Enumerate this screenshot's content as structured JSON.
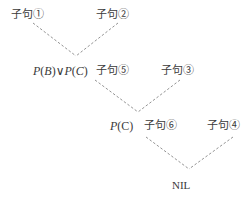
{
  "diagram": {
    "type": "resolution-refutation-tree",
    "nodes": {
      "clause1": {
        "label": "子句①"
      },
      "clause2": {
        "label": "子句②"
      },
      "resolvent1": {
        "expr_parts": [
          "P",
          "(",
          "B",
          ")",
          "∨",
          "P",
          "(",
          "C",
          ")"
        ],
        "text": "P(B)∨P(C)"
      },
      "clause5": {
        "label": "子句⑤"
      },
      "clause3": {
        "label": "子句③"
      },
      "resolvent2": {
        "expr_parts": [
          "P",
          "(",
          "C",
          ")"
        ],
        "text": "P(C)"
      },
      "clause6": {
        "label": "子句⑥"
      },
      "clause4": {
        "label": "子句④"
      },
      "result": {
        "label": "NIL"
      }
    },
    "edges": [
      {
        "from": "clause1",
        "to": "resolvent1"
      },
      {
        "from": "clause2",
        "to": "resolvent1"
      },
      {
        "from": "clause5",
        "to": "resolvent2"
      },
      {
        "from": "clause3",
        "to": "resolvent2"
      },
      {
        "from": "clause6",
        "to": "result"
      },
      {
        "from": "clause4",
        "to": "result"
      }
    ],
    "edge_color": "#777777",
    "text_color": "#3a3a3a"
  }
}
